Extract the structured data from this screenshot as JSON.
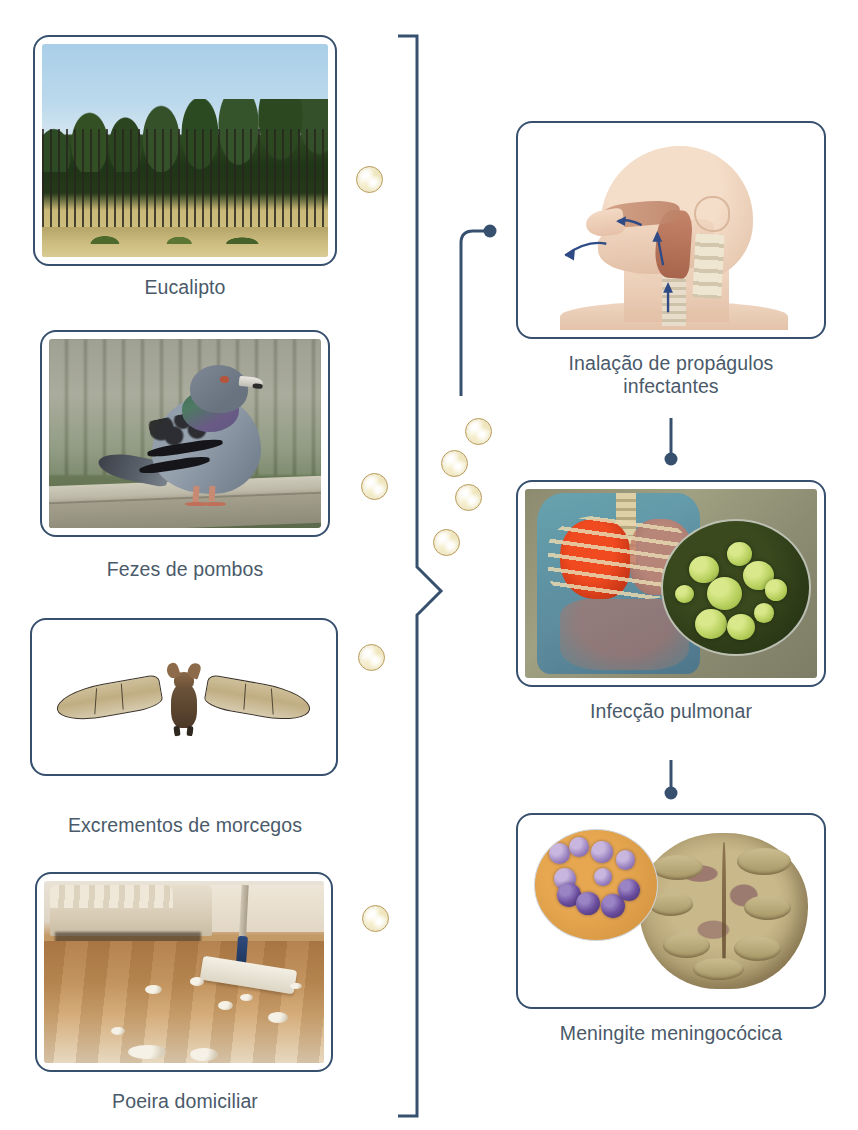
{
  "diagram": {
    "language": "pt-BR",
    "accent_color": "#36506e",
    "caption_color": "#4a5a6a",
    "spore_color": "#faf7e2",
    "spore_border_color": "#b79a58"
  },
  "sources": {
    "heading": "Fontes ambientais",
    "items": [
      {
        "id": "eucalipto",
        "label": "Eucalipto",
        "image_name": "eucalyptus-plantation-photo",
        "alt": "Plantacao de eucaliptos com troncos altos e finos"
      },
      {
        "id": "fezes-pombos",
        "label": "Fezes de pombos",
        "image_name": "pigeon-photo",
        "alt": "Pombo cinza sobre mureta de madeira"
      },
      {
        "id": "excrementos-morcegos",
        "label": "Excrementos de morcegos",
        "image_name": "bat-photo",
        "alt": "Morcego com as asas abertas sobre fundo branco"
      },
      {
        "id": "poeira-domiciliar",
        "label": "Poeira domiciliar",
        "image_name": "household-dust-photo",
        "alt": "Piso de madeira com acumulos de poeira e um rodo com pano"
      }
    ]
  },
  "pathway": {
    "steps": [
      {
        "id": "inalacao",
        "label": "Inalação de propágulos\ninfectantes",
        "image_name": "head-airway-anatomy-illustration",
        "alt": "Corte sagital de cabeca e pescoco com setas azuis indicando o fluxo de ar inalado"
      },
      {
        "id": "infeccao-pulmonar",
        "label": "Infecção pulmonar",
        "image_name": "lung-infection-illustration",
        "alt": "Torax em tons de azul com pulmao inflamado em vermelho e ampliacao de leveduras verdes"
      },
      {
        "id": "meningite",
        "label": "Meningite meningocócica",
        "image_name": "brain-meningitis-illustration",
        "alt": "Cerebro com ampliacao de diplococos roxos"
      }
    ]
  },
  "connectors": {
    "brace_name": "sources-brace",
    "elbow_name": "brace-to-inhalation-connector",
    "arrow_1_name": "inhalation-to-lung-arrow",
    "arrow_2_name": "lung-to-meningitis-arrow",
    "endpoint_style": "round-dot"
  },
  "spores": {
    "label": "propágulos infectantes",
    "count_total": 8,
    "positions": [
      {
        "x": 356,
        "y": 166
      },
      {
        "x": 361,
        "y": 473
      },
      {
        "x": 358,
        "y": 644
      },
      {
        "x": 362,
        "y": 905
      },
      {
        "x": 465,
        "y": 418
      },
      {
        "x": 441,
        "y": 450
      },
      {
        "x": 455,
        "y": 484
      },
      {
        "x": 433,
        "y": 529
      }
    ]
  }
}
